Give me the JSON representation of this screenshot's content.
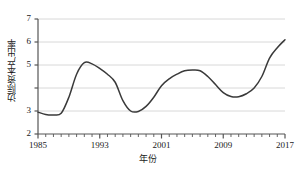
{
  "chart_data": {
    "type": "line",
    "title": "",
    "xlabel": "年份",
    "ylabel": "边际资本产出率",
    "xlim": [
      1985,
      2017
    ],
    "ylim": [
      2,
      7
    ],
    "grid": true,
    "legend": "none",
    "line_color": "#3a3a3a",
    "grid_color": "#d8d8d8",
    "axis_color": "#555555",
    "y_ticks": [
      2,
      3,
      4,
      5,
      6,
      7
    ],
    "y_tick_labels": [
      "2",
      "3",
      "",
      "5",
      "6",
      "7"
    ],
    "x_ticks": [
      1985,
      1993,
      2001,
      2009,
      2017
    ],
    "x_tick_labels": [
      "1985",
      "1993",
      "2001",
      "2009",
      "2017"
    ],
    "x_minor_ticks_every": 1,
    "x": [
      1985,
      1986,
      1987,
      1988,
      1989,
      1990,
      1991,
      1992,
      1993,
      1994,
      1995,
      1996,
      1997,
      1998,
      1999,
      2000,
      2001,
      2002,
      2003,
      2004,
      2005,
      2006,
      2007,
      2008,
      2009,
      2010,
      2011,
      2012,
      2013,
      2014,
      2015,
      2016,
      2017
    ],
    "values": [
      2.95,
      2.85,
      2.83,
      2.9,
      3.6,
      4.6,
      5.1,
      5.05,
      4.85,
      4.6,
      4.25,
      3.45,
      3.0,
      2.98,
      3.2,
      3.6,
      4.1,
      4.4,
      4.6,
      4.75,
      4.78,
      4.75,
      4.5,
      4.15,
      3.8,
      3.63,
      3.62,
      3.75,
      4.0,
      4.5,
      5.3,
      5.75,
      6.1
    ],
    "series_name": "边际资本产出率"
  },
  "axes": {
    "y_axis_name": "y-axis",
    "x_axis_name": "x-axis"
  }
}
